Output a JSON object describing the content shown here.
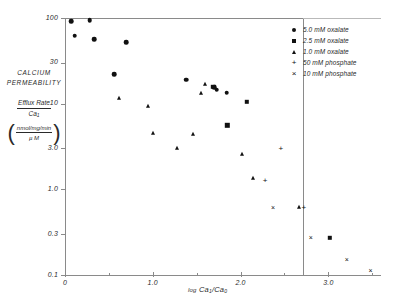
{
  "chart_data": {
    "type": "scatter",
    "title": "",
    "xlabel": "log Ca₁/Ca₀",
    "ylabel": "CALCIUM PERMEABILITY Efflux Rate / Ca₁ (nmol/mg/min / µM)",
    "xlim": [
      0,
      3.6
    ],
    "ylim": [
      0.1,
      100
    ],
    "yscale": "log",
    "grid": false,
    "legend_position": "top-right",
    "xticks": [
      "0",
      "1.0",
      "2.0",
      "3.0"
    ],
    "xtick_values": [
      0,
      1.0,
      2.0,
      3.0
    ],
    "yticks": [
      "100",
      "30",
      "10",
      "3.0",
      "1.0",
      "0.3",
      "0.1"
    ],
    "ytick_values": [
      100,
      30,
      10,
      3.0,
      1.0,
      0.3,
      0.1
    ],
    "series": [
      {
        "name": "5.0 mM oxalate",
        "marker": "circle",
        "points": [
          [
            0.07,
            92
          ],
          [
            0.11,
            62
          ],
          [
            0.28,
            94
          ],
          [
            0.33,
            57
          ],
          [
            0.7,
            52
          ],
          [
            0.56,
            22
          ],
          [
            1.38,
            19
          ],
          [
            1.73,
            14.5
          ],
          [
            1.84,
            13.5
          ],
          [
            1.7,
            15.5
          ]
        ]
      },
      {
        "name": "2.5 mM oxalate",
        "marker": "square",
        "points": [
          [
            1.69,
            15.8
          ],
          [
            2.07,
            10.5
          ],
          [
            1.85,
            5.6
          ],
          [
            3.02,
            0.27
          ]
        ]
      },
      {
        "name": "1.0 mM oxalate",
        "marker": "triangle",
        "points": [
          [
            0.62,
            11.5
          ],
          [
            0.94,
            9.3
          ],
          [
            1.0,
            4.5
          ],
          [
            1.46,
            4.4
          ],
          [
            1.6,
            17.0
          ],
          [
            1.55,
            13.5
          ],
          [
            1.28,
            3.0
          ],
          [
            2.02,
            2.6
          ],
          [
            2.14,
            1.35
          ],
          [
            2.67,
            0.63
          ]
        ]
      },
      {
        "name": "50 mM phosphate",
        "marker": "plus",
        "points": [
          [
            2.28,
            1.3
          ],
          [
            2.46,
            3.05
          ],
          [
            2.72,
            0.63
          ]
        ]
      },
      {
        "name": "10 mM phosphate",
        "marker": "cross",
        "points": [
          [
            2.37,
            0.63
          ],
          [
            2.8,
            0.28
          ],
          [
            3.21,
            0.155
          ],
          [
            3.48,
            0.115
          ]
        ]
      }
    ]
  },
  "axis": {
    "y_caption_line1": "CALCIUM",
    "y_caption_line2": "PERMEABILITY",
    "y_frac_numerator": "Efflux Rate",
    "y_frac_denominator": "Ca",
    "y_frac_denominator_sub": "1",
    "y_paren_numerator": "nmol/mg/min",
    "y_paren_denominator": "µ M",
    "paren_open": "(",
    "paren_close": ")",
    "x_title_prefix": "log",
    "x_title_main": "Ca",
    "x_title_sub1": "1",
    "x_title_slash": "/Ca",
    "x_title_sub2": "0"
  },
  "legend": {
    "items": [
      {
        "marker": "circle",
        "label": "5.0 mM oxalate"
      },
      {
        "marker": "square",
        "label": "2.5 mM oxalate"
      },
      {
        "marker": "triangle",
        "label": "1.0 mM oxalate"
      },
      {
        "marker": "plus",
        "label": "50 mM phosphate"
      },
      {
        "marker": "cross",
        "label": "10 mM phosphate"
      }
    ]
  },
  "colors": {
    "marker": "#111111",
    "axis": "#8a8a8a",
    "text": "#2a2a2a",
    "background": "#ffffff"
  }
}
